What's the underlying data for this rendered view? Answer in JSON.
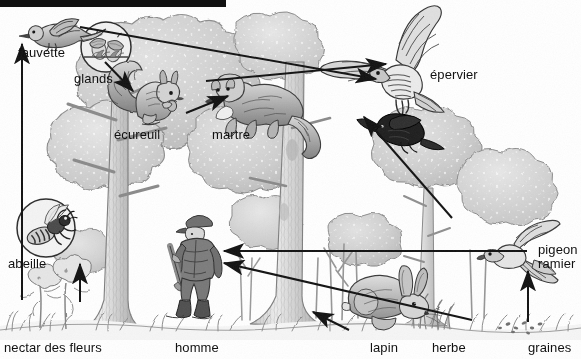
{
  "figure": {
    "type": "food-web-diagram",
    "language": "fr",
    "style": "pencil-shaded line drawing, greyscale",
    "width": 581,
    "height": 359,
    "background_color": "#ffffff",
    "ink_color": "#111111"
  },
  "top_bar": {
    "name": "black-redaction-bar",
    "x": 0,
    "y": 0,
    "width": 226,
    "height": 7,
    "color": "#111111"
  },
  "labels": [
    {
      "id": "fauvette",
      "text": "fauvette",
      "x": 18,
      "y": 46,
      "align": "left"
    },
    {
      "id": "glands",
      "text": "glands",
      "x": 74,
      "y": 72,
      "align": "left"
    },
    {
      "id": "ecureuil",
      "text": "écureuil",
      "x": 114,
      "y": 128,
      "align": "left"
    },
    {
      "id": "martre",
      "text": "martre",
      "x": 212,
      "y": 128,
      "align": "left"
    },
    {
      "id": "epervier",
      "text": "épervier",
      "x": 430,
      "y": 68,
      "align": "left"
    },
    {
      "id": "abeille",
      "text": "abeille",
      "x": 8,
      "y": 257,
      "align": "left"
    },
    {
      "id": "nectar",
      "text": "nectar des fleurs",
      "x": 4,
      "y": 341,
      "align": "left"
    },
    {
      "id": "homme",
      "text": "homme",
      "x": 175,
      "y": 341,
      "align": "left"
    },
    {
      "id": "lapin",
      "text": "lapin",
      "x": 370,
      "y": 341,
      "align": "left"
    },
    {
      "id": "herbe",
      "text": "herbe",
      "x": 432,
      "y": 341,
      "align": "left"
    },
    {
      "id": "graines",
      "text": "graines",
      "x": 528,
      "y": 341,
      "align": "left"
    },
    {
      "id": "pigeon_line1",
      "text": "pigeon",
      "x": 538,
      "y": 243,
      "align": "left"
    },
    {
      "id": "pigeon_line2",
      "text": "ramier",
      "x": 538,
      "y": 257,
      "align": "left"
    }
  ],
  "organisms": [
    {
      "id": "fauvette",
      "common_name": "fauvette",
      "group": "bird",
      "trophic_level": "insectivore",
      "x": 60,
      "y": 30
    },
    {
      "id": "glands",
      "common_name": "glands",
      "group": "seed",
      "trophic_level": "producer",
      "x": 105,
      "y": 48,
      "inset_circle": true
    },
    {
      "id": "ecureuil",
      "common_name": "écureuil",
      "group": "mammal",
      "trophic_level": "herbivore",
      "x": 150,
      "y": 100
    },
    {
      "id": "martre",
      "common_name": "martre",
      "group": "mammal",
      "trophic_level": "carnivore",
      "x": 255,
      "y": 105
    },
    {
      "id": "epervier",
      "common_name": "épervier",
      "group": "bird",
      "trophic_level": "top predator",
      "x": 400,
      "y": 60
    },
    {
      "id": "proie",
      "common_name": "oiseau (proie)",
      "group": "bird",
      "trophic_level": "prey",
      "x": 398,
      "y": 130
    },
    {
      "id": "abeille",
      "common_name": "abeille",
      "group": "insect",
      "trophic_level": "pollinator",
      "x": 45,
      "y": 228,
      "inset_circle": true
    },
    {
      "id": "nectar",
      "common_name": "nectar des fleurs",
      "group": "plant",
      "trophic_level": "producer",
      "x": 55,
      "y": 310
    },
    {
      "id": "homme",
      "common_name": "homme",
      "group": "human",
      "trophic_level": "hunter",
      "x": 196,
      "y": 275
    },
    {
      "id": "lapin",
      "common_name": "lapin",
      "group": "mammal",
      "trophic_level": "herbivore",
      "x": 390,
      "y": 305
    },
    {
      "id": "herbe",
      "common_name": "herbe",
      "group": "plant",
      "trophic_level": "producer",
      "x": 448,
      "y": 315
    },
    {
      "id": "graines",
      "common_name": "graines",
      "group": "seed",
      "trophic_level": "producer",
      "x": 540,
      "y": 322
    },
    {
      "id": "pigeon",
      "common_name": "pigeon ramier",
      "group": "bird",
      "trophic_level": "granivore",
      "x": 516,
      "y": 255
    }
  ],
  "arrows": [
    {
      "id": "nectar-to-abeille",
      "from": "nectar",
      "to": "abeille",
      "x1": 80,
      "y1": 300,
      "x2": 80,
      "y2": 265
    },
    {
      "id": "abeille-to-fauvette",
      "from": "abeille",
      "to": "fauvette",
      "x1": 22,
      "y1": 300,
      "x2": 22,
      "y2": 42
    },
    {
      "id": "glands-to-ecureuil",
      "from": "glands",
      "to": "ecureuil",
      "x1": 108,
      "y1": 60,
      "x2": 134,
      "y2": 90
    },
    {
      "id": "ecureuil-to-martre",
      "from": "ecureuil",
      "to": "martre",
      "x1": 188,
      "y1": 112,
      "x2": 228,
      "y2": 95
    },
    {
      "id": "fauvette-to-epervier",
      "from": "fauvette",
      "to": "epervier",
      "x1": 78,
      "y1": 30,
      "x2": 376,
      "y2": 78
    },
    {
      "id": "martre-to-epervier",
      "from": "martre",
      "to": "epervier",
      "x1": 210,
      "y1": 80,
      "x2": 384,
      "y2": 64
    },
    {
      "id": "proie-to-epervier",
      "from": "pigeon",
      "to": "epervier",
      "x1": 450,
      "y1": 215,
      "x2": 362,
      "y2": 116
    },
    {
      "id": "graines-to-pigeon",
      "from": "graines",
      "to": "pigeon",
      "x1": 528,
      "y1": 322,
      "x2": 528,
      "y2": 272
    },
    {
      "id": "herbe-to-lapin",
      "from": "herbe",
      "to": "lapin",
      "x1": 348,
      "y1": 330,
      "x2": 312,
      "y2": 312
    },
    {
      "id": "pigeon-to-homme",
      "from": "pigeon",
      "to": "homme",
      "x1": 525,
      "y1": 252,
      "x2": 226,
      "y2": 252
    },
    {
      "id": "lapin-to-homme",
      "from": "lapin",
      "to": "homme",
      "x1": 470,
      "y1": 320,
      "x2": 226,
      "y2": 264
    }
  ],
  "food_chains": [
    "nectar des fleurs → abeille → fauvette → épervier",
    "glands → écureuil → martre → épervier",
    "graines → pigeon ramier → épervier",
    "graines → pigeon ramier → homme",
    "herbe → lapin → homme"
  ],
  "scene": {
    "habitat": "forêt de feuillus",
    "elements": [
      "chêne",
      "arbres",
      "feuillage",
      "herbe",
      "sol"
    ]
  }
}
